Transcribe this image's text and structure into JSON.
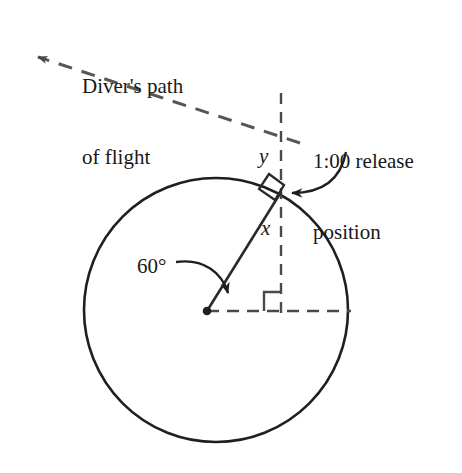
{
  "figure": {
    "name": "diver-release-geometry-diagram",
    "background_color": "#ffffff",
    "stroke_color": "#1f1f1f",
    "labels": {
      "flight_path_line1": "Diver's path",
      "flight_path_line2": "of flight",
      "release_line1": "1:00 release",
      "release_line2": "position",
      "angle": "60°",
      "vertical_segment": "y",
      "radius_segment": "x"
    },
    "geometry": {
      "circle": {
        "cx": 216,
        "cy": 310,
        "r": 132
      },
      "center_dot": {
        "cx": 207,
        "cy": 311,
        "r": 4
      },
      "release_point": {
        "x": 281,
        "y": 192
      },
      "vertical_dashed_line": {
        "x": 281,
        "y_top": 93,
        "y_bottom": 316
      },
      "horizontal_dashed_line": {
        "y": 311,
        "x_left": 207,
        "x_right": 350
      },
      "radius_line": {
        "x1": 207,
        "y1": 311,
        "x2": 281,
        "y2": 192
      },
      "flight_path_dashed": {
        "x1": 300,
        "y1": 143,
        "x2": 33,
        "y2": 55
      },
      "angle_value_degrees": 60,
      "right_angle_markers": 2
    }
  }
}
